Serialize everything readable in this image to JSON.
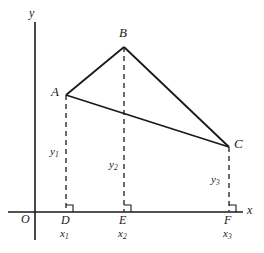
{
  "figure": {
    "axes": {
      "x_label": "x",
      "y_label": "y",
      "origin_label": "O"
    },
    "vertices": [
      {
        "name": "A",
        "label": "A",
        "x": 66,
        "y": 95
      },
      {
        "name": "B",
        "label": "B",
        "x": 124,
        "y": 47
      },
      {
        "name": "C",
        "label": "C",
        "x": 229,
        "y": 147
      }
    ],
    "feet": [
      {
        "name": "D",
        "label": "D",
        "coord_label": "x",
        "coord_sub": "1",
        "x": 66
      },
      {
        "name": "E",
        "label": "E",
        "coord_label": "x",
        "coord_sub": "2",
        "x": 124
      },
      {
        "name": "F",
        "label": "F",
        "coord_label": "x",
        "coord_sub": "3",
        "x": 229
      }
    ],
    "heights": [
      {
        "name": "y1",
        "label": "y",
        "sub": "1"
      },
      {
        "name": "y2",
        "label": "y",
        "sub": "2"
      },
      {
        "name": "y3",
        "label": "y",
        "sub": "3"
      }
    ],
    "colors": {
      "stroke": "#1a1a1a",
      "dashed": "#3a3a3a",
      "background": "#ffffff"
    }
  }
}
